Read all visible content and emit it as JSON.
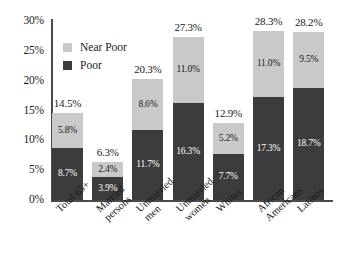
{
  "chart_data": {
    "type": "bar",
    "subtype": "stacked-vertical",
    "title": "",
    "xlabel": "",
    "ylabel": "",
    "ylim": [
      0,
      30
    ],
    "ytick_labels": [
      "30%",
      "25%",
      "20%",
      "15%",
      "10%",
      "5%",
      "0%"
    ],
    "ytick_values": [
      30,
      25,
      20,
      15,
      10,
      5,
      0
    ],
    "grid": false,
    "legend_position": "inside-top-left",
    "categories": [
      "Total 65+",
      "Married persons",
      "Unmarried men",
      "Unmarried women",
      "Whites",
      "African Americans",
      "Latinos"
    ],
    "category_lines": [
      [
        "Total 65+"
      ],
      [
        "Married",
        "persons"
      ],
      [
        "Unmarried",
        "men"
      ],
      [
        "Unmarried",
        "women"
      ],
      [
        "Whites"
      ],
      [
        "African",
        "Americans"
      ],
      [
        "Latinos"
      ]
    ],
    "series": [
      {
        "name": "Poor",
        "color": "#3c3c3c",
        "values": [
          8.7,
          3.9,
          11.7,
          16.3,
          7.7,
          17.3,
          18.7
        ],
        "labels": [
          "8.7%",
          "3.9%",
          "11.7%",
          "16.3%",
          "7.7%",
          "17.3%",
          "18.7%"
        ]
      },
      {
        "name": "Near Poor",
        "color": "#c9c9c9",
        "values": [
          5.8,
          2.4,
          8.6,
          11.0,
          5.2,
          11.0,
          9.5
        ],
        "labels": [
          "5.8%",
          "2.4%",
          "8.6%",
          "11.0%",
          "5.2%",
          "11.0%",
          "9.5%"
        ]
      }
    ],
    "totals": [
      14.5,
      6.3,
      20.3,
      27.3,
      12.9,
      28.3,
      28.2
    ],
    "total_labels": [
      "14.5%",
      "6.3%",
      "20.3%",
      "27.3%",
      "12.9%",
      "28.3%",
      "28.2%"
    ]
  },
  "legend": {
    "items": [
      {
        "label": "Near Poor",
        "color": "#c9c9c9"
      },
      {
        "label": "Poor",
        "color": "#3c3c3c"
      }
    ]
  },
  "colors": {
    "near_poor": "#c9c9c9",
    "poor": "#3c3c3c",
    "axis": "#4a4a4a",
    "text": "#1a1a1a",
    "background": "#ffffff"
  }
}
